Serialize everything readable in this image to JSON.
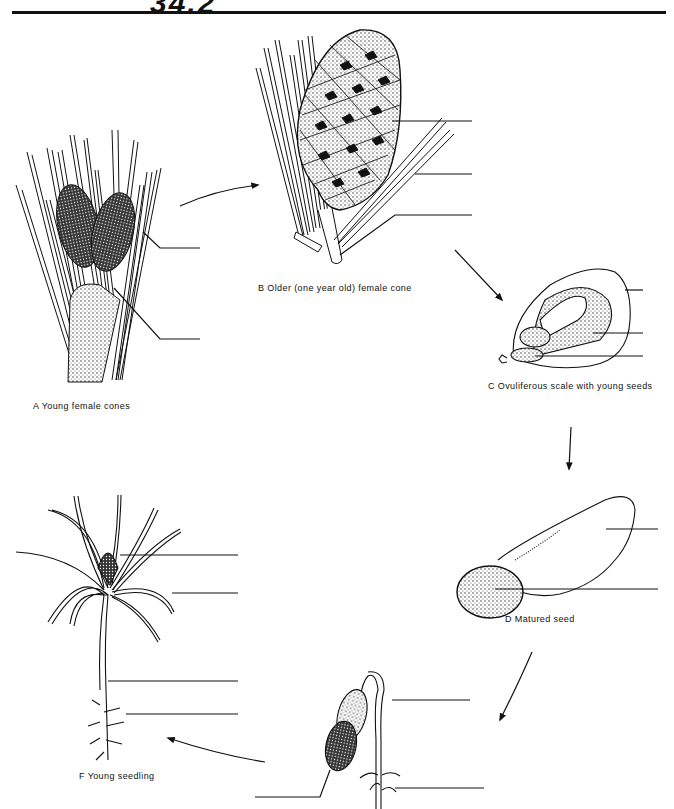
{
  "page": {
    "title_fragment": "34.2"
  },
  "panels": [
    {
      "id": "A",
      "letter": "A",
      "caption": "Young female cones",
      "blank_label_count": 2
    },
    {
      "id": "B",
      "letter": "B",
      "caption": "Older (one year old) female cone",
      "blank_label_count": 3
    },
    {
      "id": "C",
      "letter": "C",
      "caption": "Ovuliferous scale with young seeds",
      "blank_label_count": 3
    },
    {
      "id": "D",
      "letter": "D",
      "caption": "Matured seed",
      "blank_label_count": 2
    },
    {
      "id": "E",
      "letter": "",
      "caption": "",
      "blank_label_count": 3
    },
    {
      "id": "F",
      "letter": "F",
      "caption": "Young seedling",
      "blank_label_count": 4
    }
  ],
  "captions": {
    "a": "A  Young female cones",
    "b": "B  Older (one year old) female cone",
    "c": "C  Ovuliferous scale with young seeds",
    "d": "D  Matured seed",
    "f": "F  Young seedling"
  },
  "colors": {
    "ink": "#111111",
    "paper": "#ffffff"
  }
}
